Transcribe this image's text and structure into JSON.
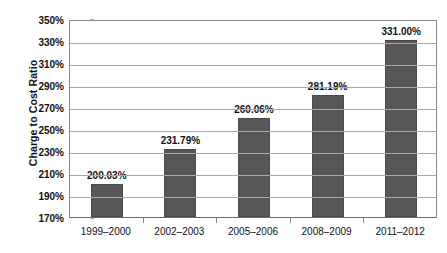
{
  "chart_data": {
    "type": "bar",
    "title": "",
    "xlabel": "",
    "ylabel": "Charge to Cost Ratio",
    "categories": [
      "1999–2000",
      "2002–2003",
      "2005–2006",
      "2008–2009",
      "2011–2012"
    ],
    "values": [
      200.03,
      231.79,
      260.06,
      281.19,
      331.0
    ],
    "data_labels": [
      "200.03%",
      "231.79%",
      "260.06%",
      "281.19%",
      "331.00%"
    ],
    "ylim": [
      170,
      350
    ],
    "ytick_values": [
      350,
      330,
      310,
      290,
      270,
      250,
      230,
      210,
      190,
      170
    ],
    "ytick_labels": [
      "350%",
      "330%",
      "310%",
      "290%",
      "270%",
      "250%",
      "230%",
      "210%",
      "190%",
      "170%"
    ],
    "grid": true,
    "legend": null,
    "series": [
      {
        "name": "Charge to Cost Ratio",
        "values": [
          200.03,
          231.79,
          260.06,
          281.19,
          331.0
        ],
        "color": "#575757"
      }
    ],
    "colors": {
      "bar_fill": "#575757",
      "bar_border": "#4a4a4a",
      "gridline": "#a9a9a9",
      "axis": "#8a8a8a",
      "text": "#111111",
      "background": "#ffffff"
    }
  }
}
